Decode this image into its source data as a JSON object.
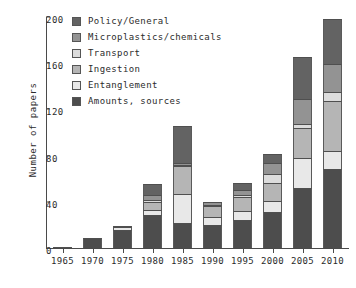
{
  "chart_data": {
    "type": "bar",
    "subtype": "stacked-vertical",
    "title": "",
    "xlabel": "",
    "ylabel": "Number of papers",
    "categories": [
      "1965",
      "1970",
      "1975",
      "1980",
      "1985",
      "1990",
      "1995",
      "2000",
      "2005",
      "2010"
    ],
    "ylim": [
      0,
      200
    ],
    "yticks": [
      0,
      40,
      80,
      120,
      160,
      200
    ],
    "xticks": [
      "1965",
      "1970",
      "1975",
      "1980",
      "1985",
      "1990",
      "1995",
      "2000",
      "2005",
      "2010"
    ],
    "grid": false,
    "legend_position": "top-left",
    "stack_order_bottom_to_top": [
      "Amounts, sources",
      "Entanglement",
      "Ingestion",
      "Transport",
      "Microplastics/chemicals",
      "Policy/General"
    ],
    "series": [
      {
        "name": "Amounts, sources",
        "color": "#4d4d4d",
        "values": [
          1,
          9,
          16,
          29,
          22,
          20,
          24,
          31,
          52,
          68
        ]
      },
      {
        "name": "Entanglement",
        "color": "#e8e8e8",
        "values": [
          0,
          0,
          2,
          4,
          25,
          7,
          8,
          10,
          26,
          16
        ]
      },
      {
        "name": "Ingestion",
        "color": "#b5b5b5",
        "values": [
          0,
          0,
          1,
          7,
          24,
          9,
          12,
          15,
          26,
          43
        ]
      },
      {
        "name": "Transport",
        "color": "#dcdcdc",
        "values": [
          0,
          0,
          0,
          2,
          1,
          1,
          2,
          8,
          3,
          8
        ]
      },
      {
        "name": "Microplastics/chemicals",
        "color": "#939393",
        "values": [
          0,
          0,
          0,
          4,
          2,
          3,
          4,
          10,
          22,
          24
        ]
      },
      {
        "name": "Policy/General",
        "color": "#636363",
        "values": [
          0,
          0,
          0,
          9,
          32,
          0,
          6,
          7,
          36,
          39
        ]
      }
    ],
    "totals": [
      1,
      9,
      19,
      55,
      106,
      40,
      56,
      81,
      165,
      198
    ]
  },
  "legend": {
    "entries": [
      {
        "label": "Policy/General",
        "color": "#636363"
      },
      {
        "label": "Microplastics/chemicals",
        "color": "#939393"
      },
      {
        "label": "Transport",
        "color": "#dcdcdc"
      },
      {
        "label": "Ingestion",
        "color": "#b5b5b5"
      },
      {
        "label": "Entanglement",
        "color": "#e8e8e8"
      },
      {
        "label": "Amounts, sources",
        "color": "#4d4d4d"
      }
    ]
  }
}
